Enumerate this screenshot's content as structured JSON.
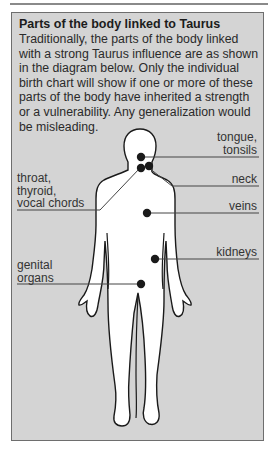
{
  "header": {
    "title": "Parts of the body linked to Taurus",
    "description": "Traditionally, the parts of the body linked with a strong Taurus influence are as shown in the diagram below. Only the individual birth chart will show if one or more of these parts of the body have inherited a strength or a vulnerability. Any generalization would be misleading."
  },
  "labels": {
    "tongue": "tongue,",
    "tonsils": "tonsils",
    "neck": "neck",
    "throat": "throat,",
    "thyroid": "thyroid,",
    "vocal": "vocal chords",
    "veins": "veins",
    "kidneys": "kidneys",
    "genital": "genital",
    "organs": "organs"
  },
  "colors": {
    "panel_bg": "#d4d4d4",
    "border": "#6e6e6e",
    "dot": "#1a1a1a",
    "leader_line": "#444444",
    "figure_fill": "#ffffff"
  }
}
